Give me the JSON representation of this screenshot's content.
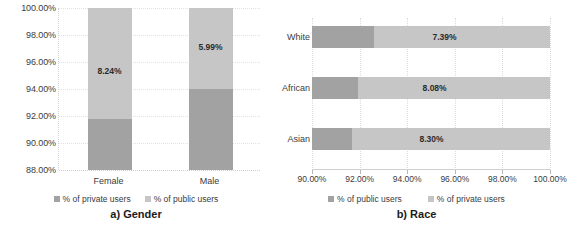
{
  "chart_data": [
    {
      "id": "gender",
      "type": "bar",
      "orientation": "vertical",
      "stacked": true,
      "title": "a) Gender",
      "xlabel": "",
      "ylabel": "",
      "ylim": [
        88.0,
        100.0
      ],
      "ytick_labels": [
        "100.00%",
        "98.00%",
        "96.00%",
        "94.00%",
        "92.00%",
        "90.00%",
        "88.00%"
      ],
      "ytick_values": [
        100.0,
        98.0,
        96.0,
        94.0,
        92.0,
        90.0,
        88.0
      ],
      "grid": true,
      "legend_position": "bottom",
      "categories": [
        "Female",
        "Male"
      ],
      "series": [
        {
          "name": "% of private users",
          "color": "#a2a2a2",
          "values": [
            91.76,
            94.01
          ],
          "note": "cumulative top of dark segment, axis starts at 88.00%"
        },
        {
          "name": "% of public users",
          "color": "#c6c6c6",
          "values": [
            8.24,
            5.99
          ],
          "labels": [
            "8.24%",
            "5.99%"
          ]
        }
      ]
    },
    {
      "id": "race",
      "type": "bar",
      "orientation": "horizontal",
      "stacked": true,
      "title": "b) Race",
      "xlabel": "",
      "ylabel": "",
      "xlim": [
        90.0,
        100.0
      ],
      "xtick_labels": [
        "90.00%",
        "92.00%",
        "94.00%",
        "96.00%",
        "98.00%",
        "100.00%"
      ],
      "xtick_values": [
        90.0,
        92.0,
        94.0,
        96.0,
        98.0,
        100.0
      ],
      "grid": true,
      "legend_position": "bottom",
      "categories": [
        "White",
        "African",
        "Asian"
      ],
      "series": [
        {
          "name": "% of public users",
          "color": "#a2a2a2",
          "values": [
            92.61,
            91.92,
            91.7
          ],
          "note": "cumulative end of dark segment, axis starts at 90.00%"
        },
        {
          "name": "% of private users",
          "color": "#c6c6c6",
          "values": [
            7.39,
            8.08,
            8.3
          ],
          "labels": [
            "7.39%",
            "8.08%",
            "8.30%"
          ]
        }
      ]
    }
  ],
  "left_chart": {
    "caption": "a) Gender",
    "y_ticks": [
      "100.00%",
      "98.00%",
      "96.00%",
      "94.00%",
      "92.00%",
      "90.00%",
      "88.00%"
    ],
    "categories": [
      "Female",
      "Male"
    ],
    "bar_labels": [
      "8.24%",
      "5.99%"
    ],
    "legend": [
      {
        "label": "% of private users",
        "color": "#a2a2a2"
      },
      {
        "label": "% of public users",
        "color": "#c6c6c6"
      }
    ]
  },
  "right_chart": {
    "caption": "b) Race",
    "x_ticks": [
      "90.00%",
      "92.00%",
      "94.00%",
      "96.00%",
      "98.00%",
      "100.00%"
    ],
    "categories": [
      "White",
      "African",
      "Asian"
    ],
    "bar_labels": [
      "7.39%",
      "8.08%",
      "8.30%"
    ],
    "legend": [
      {
        "label": "% of public users",
        "color": "#a2a2a2"
      },
      {
        "label": "% of private users",
        "color": "#c6c6c6"
      }
    ]
  },
  "colors": {
    "dark_gray": "#a2a2a2",
    "light_gray": "#c6c6c6",
    "grid": "#e2e2e2",
    "text": "#3b3b3b"
  }
}
